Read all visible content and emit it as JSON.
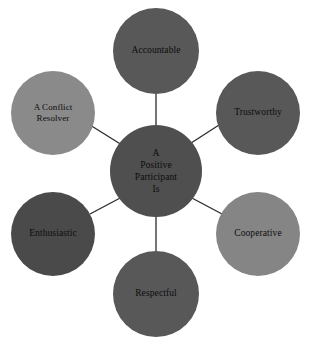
{
  "diagram": {
    "type": "hub-and-spoke",
    "background_color": "#ffffff",
    "connector_color": "#2b2b2b",
    "text_color": "#0d0d0d",
    "center": {
      "id": "center",
      "label": "A Positive Participant Is",
      "lines": [
        "A",
        "Positive",
        "Participant",
        "Is"
      ],
      "fill": "#4f4f4f"
    },
    "nodes": [
      {
        "id": "accountable",
        "label": "Accountable",
        "lines": [
          "Accountable"
        ],
        "fill": "#585858",
        "position": "top"
      },
      {
        "id": "trustworthy",
        "label": "Trustworthy",
        "lines": [
          "Trustworthy"
        ],
        "fill": "#585858",
        "position": "top-right"
      },
      {
        "id": "cooperative",
        "label": "Cooperative",
        "lines": [
          "Cooperative"
        ],
        "fill": "#858585",
        "position": "bottom-right"
      },
      {
        "id": "respectful",
        "label": "Respectful",
        "lines": [
          "Respectful"
        ],
        "fill": "#585858",
        "position": "bottom"
      },
      {
        "id": "enthusiastic",
        "label": "Enthusiastic",
        "lines": [
          "Enthusiastic"
        ],
        "fill": "#4a4a4a",
        "position": "bottom-left"
      },
      {
        "id": "conflict-resolver",
        "label": "A Conflict Resolver",
        "lines": [
          "A Conflict",
          "Resolver"
        ],
        "fill": "#8a8a8a",
        "position": "top-left"
      }
    ],
    "connectors": [
      {
        "from": "center",
        "to": "accountable"
      },
      {
        "from": "center",
        "to": "trustworthy"
      },
      {
        "from": "center",
        "to": "cooperative"
      },
      {
        "from": "center",
        "to": "respectful"
      },
      {
        "from": "center",
        "to": "enthusiastic"
      },
      {
        "from": "center",
        "to": "conflict-resolver"
      }
    ]
  }
}
